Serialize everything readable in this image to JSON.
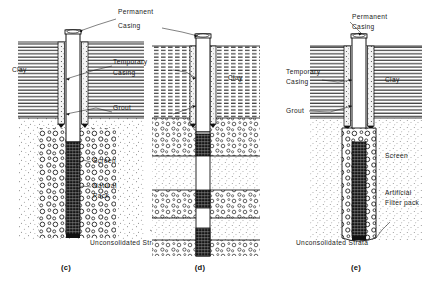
{
  "figure": {
    "background_color": "#ffffff",
    "ink_color": "#111111"
  },
  "panels": [
    {
      "id": "c",
      "caption": "(c)",
      "caption_x": 66,
      "caption_y": 270,
      "description": "Naturally developed well with permanent casing grouted through clay and screen set in natural pack",
      "center_x": 72,
      "labels": [
        {
          "name": "clay",
          "text": "Clay",
          "x": 12,
          "y": 72
        },
        {
          "name": "screen",
          "text": "Screen",
          "x": 93,
          "y": 163
        },
        {
          "name": "natural-pack-line1",
          "text": "Natural",
          "x": 93,
          "y": 188
        },
        {
          "name": "natural-pack-line2",
          "text": "Pack",
          "x": 93,
          "y": 198
        },
        {
          "name": "unconsolidated-strata",
          "text": "Unconsolidated  Strata",
          "x": 90,
          "y": 245
        }
      ]
    },
    {
      "id": "d",
      "caption": "(d)",
      "caption_x": 200,
      "caption_y": 270,
      "description": "Multiple screen sections opposite separate water bearing strata",
      "center_x": 203,
      "labels": [
        {
          "name": "clay",
          "text": "Clay",
          "x": 228,
          "y": 80
        }
      ]
    },
    {
      "id": "e",
      "caption": "(e)",
      "caption_x": 356,
      "caption_y": 270,
      "description": "Gravel packed well with artificial filter pack surrounding the screen",
      "center_x": 360,
      "labels": [
        {
          "name": "permanent-casing-line1",
          "text": "Permanent",
          "x": 352,
          "y": 19
        },
        {
          "name": "permanent-casing-line2",
          "text": "Casing",
          "x": 352,
          "y": 29
        },
        {
          "name": "temporary-casing-line1",
          "text": "Temporary",
          "x": 286,
          "y": 74
        },
        {
          "name": "temporary-casing-line2",
          "text": "Casing",
          "x": 286,
          "y": 84
        },
        {
          "name": "grout",
          "text": "Grout",
          "x": 286,
          "y": 113
        },
        {
          "name": "clay",
          "text": "Clay",
          "x": 385,
          "y": 82
        },
        {
          "name": "screen",
          "text": "Screen",
          "x": 385,
          "y": 158
        },
        {
          "name": "artificial-filter-pack-line1",
          "text": "Artificial",
          "x": 385,
          "y": 195
        },
        {
          "name": "artificial-filter-pack-line2",
          "text": "Filter pack",
          "x": 385,
          "y": 205
        },
        {
          "name": "unconsolidated-strata",
          "text": "Unconsolidated  Strata",
          "x": 296,
          "y": 245
        }
      ]
    }
  ],
  "shared_labels": [
    {
      "name": "permanent-casing-line1",
      "text": "Permanent",
      "x": 118,
      "y": 14
    },
    {
      "name": "permanent-casing-line2",
      "text": "Casing",
      "x": 118,
      "y": 28
    },
    {
      "name": "temporary-casing-line1",
      "text": "Temporary",
      "x": 113,
      "y": 64
    },
    {
      "name": "temporary-casing-line2",
      "text": "Casing",
      "x": 113,
      "y": 75
    },
    {
      "name": "grout",
      "text": "Grout",
      "x": 113,
      "y": 110
    }
  ],
  "geology": {
    "clay_layer": {
      "name": "Clay",
      "pattern": "horizontal-hatch",
      "top_y": 42,
      "bottom_y": 118
    },
    "unconsolidated_layer": {
      "name": "Unconsolidated Strata",
      "pattern": "stipple",
      "top_y": 118,
      "bottom_y": 240
    }
  },
  "components": {
    "permanent_casing": "Permanent Casing",
    "temporary_casing": "Temporary Casing",
    "grout": "Grout",
    "screen": "Screen",
    "natural_pack": "Natural Pack",
    "artificial_filter_pack": "Artificial Filter pack"
  }
}
